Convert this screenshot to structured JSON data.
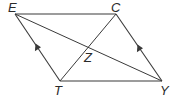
{
  "diagram": {
    "type": "parallelogram-with-diagonals",
    "colors": {
      "stroke": "#3a3a3a",
      "label": "#2a2a2a",
      "background": "#ffffff"
    },
    "vertices": {
      "E": {
        "label": "E",
        "x": 15,
        "y": 14
      },
      "C": {
        "label": "C",
        "x": 116,
        "y": 14
      },
      "T": {
        "label": "T",
        "x": 60,
        "y": 81
      },
      "Y": {
        "label": "Y",
        "x": 162,
        "y": 81
      }
    },
    "intersection": {
      "label": "Z",
      "x": 88,
      "y": 48
    },
    "edges": [
      {
        "from": "E",
        "to": "C"
      },
      {
        "from": "T",
        "to": "Y"
      },
      {
        "from": "E",
        "to": "T",
        "arrow": "toward-E"
      },
      {
        "from": "C",
        "to": "Y",
        "arrow": "toward-C"
      }
    ],
    "diagonals": [
      {
        "from": "E",
        "to": "Y"
      },
      {
        "from": "T",
        "to": "C"
      }
    ],
    "labels": {
      "E": "E",
      "C": "C",
      "T": "T",
      "Y": "Y",
      "Z": "Z"
    }
  }
}
